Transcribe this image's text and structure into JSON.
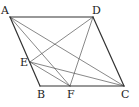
{
  "diagram": {
    "type": "geometry",
    "shape": "parallelogram ABCD",
    "stroke_color": "#333333",
    "thin_stroke_color": "#555555",
    "points": {
      "A": {
        "x": 10,
        "y": 17
      },
      "B": {
        "x": 40,
        "y": 86
      },
      "C": {
        "x": 124,
        "y": 86
      },
      "D": {
        "x": 93,
        "y": 17
      },
      "E": {
        "x": 30,
        "y": 62
      },
      "F": {
        "x": 70,
        "y": 86
      }
    },
    "sides": [
      [
        "A",
        "B"
      ],
      [
        "B",
        "C"
      ],
      [
        "C",
        "D"
      ],
      [
        "D",
        "A"
      ]
    ],
    "segments": [
      [
        "A",
        "C"
      ],
      [
        "A",
        "F"
      ],
      [
        "D",
        "E"
      ],
      [
        "D",
        "F"
      ],
      [
        "E",
        "C"
      ],
      [
        "E",
        "F"
      ]
    ],
    "labels": [
      {
        "text": "A",
        "x": 1,
        "y": 5
      },
      {
        "text": "D",
        "x": 92,
        "y": 5
      },
      {
        "text": "E",
        "x": 20,
        "y": 57
      },
      {
        "text": "B",
        "x": 37,
        "y": 89
      },
      {
        "text": "F",
        "x": 67,
        "y": 89
      },
      {
        "text": "C",
        "x": 121,
        "y": 89
      }
    ]
  }
}
